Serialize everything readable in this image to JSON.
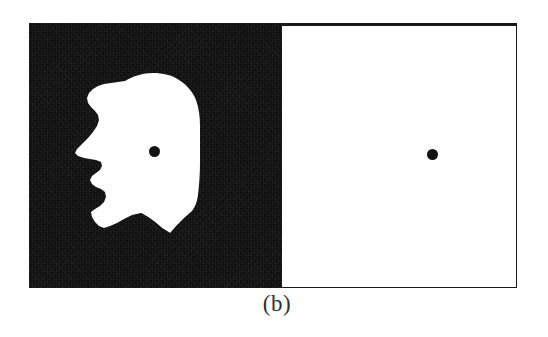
{
  "figure": {
    "caption": "(b)",
    "panels": [
      {
        "id": "panel-left",
        "name": "face-silhouette-panel",
        "background_color": "#0d0d0d",
        "figure_color": "#ffffff",
        "content": "white face profile silhouette facing left on black ground",
        "fixation_dot": {
          "label": "fixation-dot",
          "color": "#121212",
          "diameter_px": 11
        }
      },
      {
        "id": "panel-right",
        "name": "blank-white-panel",
        "background_color": "#ffffff",
        "border_color": "#1a1a1a",
        "content": "empty white field",
        "fixation_dot": {
          "label": "fixation-dot",
          "color": "#121212",
          "diameter_px": 11
        }
      }
    ]
  },
  "colors": {
    "ink": "#0d0d0d",
    "paper": "#ffffff",
    "border": "#1a1a1a",
    "caption_text": "#303030"
  }
}
